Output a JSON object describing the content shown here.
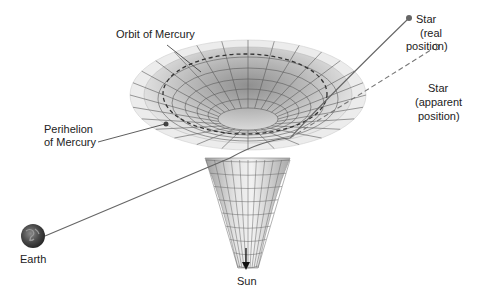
{
  "diagram": {
    "labels": {
      "orbit": "Orbit of Mercury",
      "perihelion_line1": "Perihelion",
      "perihelion_line2": "of Mercury",
      "star_real_line1": "Star",
      "star_real_line2": "(real",
      "star_real_line3": "position)",
      "star_apparent_line1": "Star",
      "star_apparent_line2": "(apparent",
      "star_apparent_line3": "position)",
      "earth": "Earth",
      "sun": "Sun"
    },
    "colors": {
      "surface_light": "#eeeeee",
      "surface_mid": "#cfcfcf",
      "surface_dark": "#9a9a9a",
      "grid": "#555555",
      "light_path": "#666666",
      "text": "#222222"
    }
  }
}
